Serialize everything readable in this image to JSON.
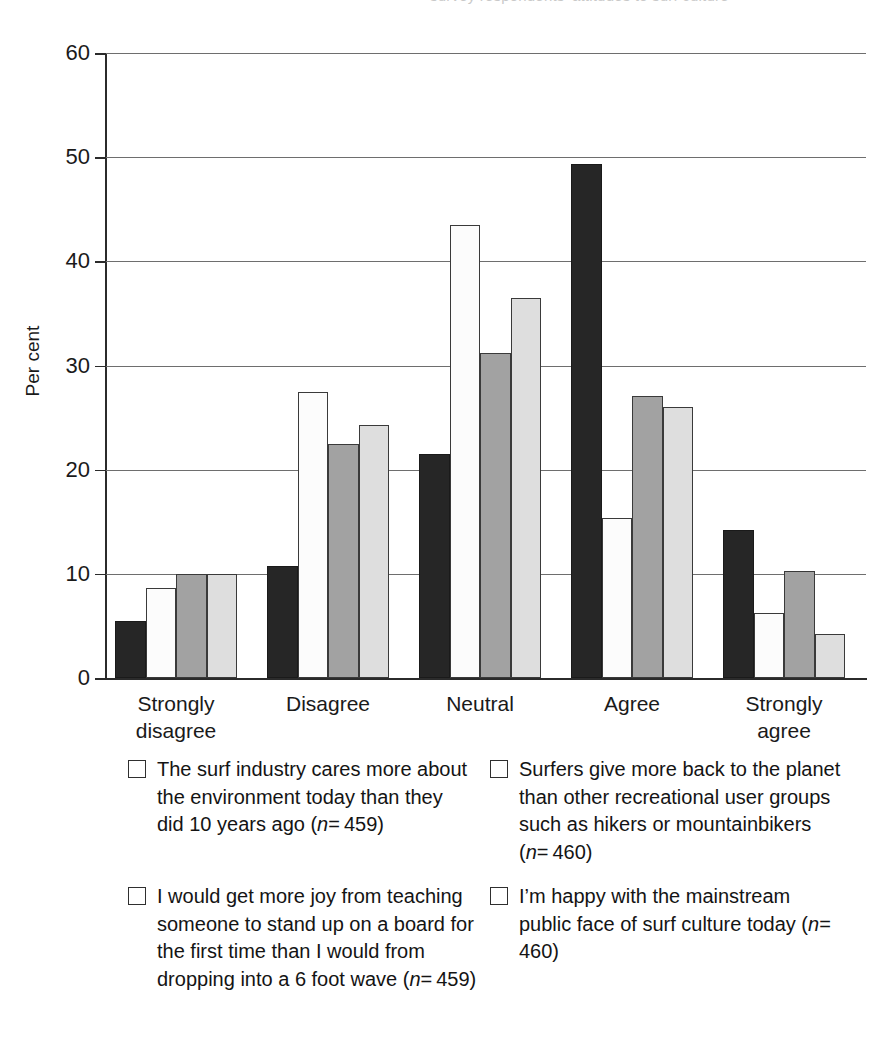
{
  "top_cut_caption": "survey respondents' attitudes to surf culture",
  "axis": {
    "ylabel": "Per cent",
    "yticks": [
      0,
      10,
      20,
      30,
      40,
      50,
      60
    ]
  },
  "legend": {
    "items": [
      {
        "swatch": "series-1-dark-swatch",
        "color": "#262626",
        "text": "The surf industry cares more about the environment today than they did 10 years ago (n= 459)"
      },
      {
        "swatch": "series-2-white-swatch",
        "color": "#fcfcfc",
        "text": "Surfers give more back to the planet than other recreational user groups such as hikers or mountainbikers (n= 460)"
      },
      {
        "swatch": "series-3-midgray-swatch",
        "color": "#a2a2a2",
        "text": "I would get more joy from teaching someone to stand up on a board for the first time than I would from dropping into a 6 foot wave (n= 459)"
      },
      {
        "swatch": "series-4-lightgray-swatch",
        "color": "#dedede",
        "text": "I’m happy with the mainstream public face of surf culture today (n= 460)"
      }
    ]
  },
  "chart_data": {
    "type": "bar",
    "title": "",
    "xlabel": "",
    "ylabel": "Per cent",
    "ylim": [
      0,
      60
    ],
    "ytick_step": 10,
    "grid": true,
    "legend_position": "below",
    "categories": [
      "Strongly disagree",
      "Disagree",
      "Neutral",
      "Agree",
      "Strongly agree"
    ],
    "category_lines": [
      [
        "Strongly",
        "disagree"
      ],
      [
        "Disagree",
        ""
      ],
      [
        "Neutral",
        ""
      ],
      [
        "Agree",
        ""
      ],
      [
        "Strongly",
        "agree"
      ]
    ],
    "series": [
      {
        "name": "The surf industry cares more about the environment today than they did 10 years ago (n= 459)",
        "color": "#262626",
        "n": 459,
        "values": [
          5.5,
          10.8,
          21.5,
          49.3,
          14.2
        ]
      },
      {
        "name": "Surfers give more back to the planet than other recreational user groups such as hikers or mountainbikers (n= 460)",
        "color": "#fcfcfc",
        "n": 460,
        "values": [
          8.6,
          27.5,
          43.5,
          15.4,
          6.2
        ]
      },
      {
        "name": "I would get more joy from teaching someone to stand up on a board for the first time than I would from dropping into a 6 foot wave (n= 459)",
        "color": "#a2a2a2",
        "n": 459,
        "values": [
          10.0,
          22.5,
          31.2,
          27.1,
          10.3
        ]
      },
      {
        "name": "I’m happy with the mainstream public face of surf culture today (n= 460)",
        "color": "#dedede",
        "n": 460,
        "values": [
          10.0,
          24.3,
          36.5,
          26.0,
          4.2
        ]
      }
    ]
  }
}
